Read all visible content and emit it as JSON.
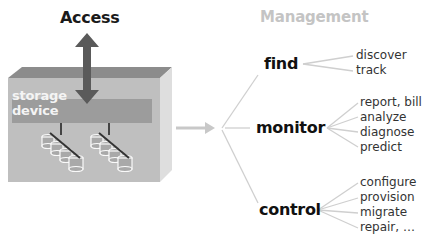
{
  "left": {
    "access_label": "Access",
    "device_label_line1": "storage",
    "device_label_line2": "device",
    "colors": {
      "box_front": "#bdbdbd",
      "box_top": "#8c8c8c",
      "box_side": "#dcdcdc",
      "band": "#9a9a9a",
      "arrow": "#5a5a5a"
    }
  },
  "right": {
    "title": "Management",
    "categories": [
      {
        "label": "find",
        "items": [
          "discover",
          "track"
        ]
      },
      {
        "label": "monitor",
        "items": [
          "report, bill",
          "analyze",
          "diagnose",
          "predict"
        ]
      },
      {
        "label": "control",
        "items": [
          "configure",
          "provision",
          "migrate",
          "repair, …"
        ]
      }
    ]
  }
}
